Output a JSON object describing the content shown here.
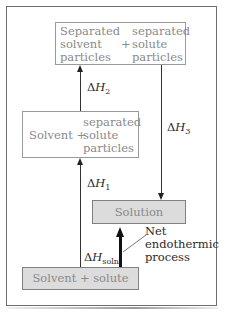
{
  "diagram": {
    "type": "enthalpy-of-solution",
    "boxes": {
      "top": {
        "left_col": [
          "Separated",
          "solvent",
          "particles"
        ],
        "plus": "+",
        "right_col": [
          "separated",
          "solute",
          "particles"
        ]
      },
      "middle": {
        "left": "Solvent +",
        "right_col": [
          "separated",
          "solute",
          "particles"
        ]
      },
      "solution": {
        "label": "Solution"
      },
      "bottom": {
        "label": "Solvent + solute"
      }
    },
    "arrows": {
      "dH1": {
        "delta": "Δ",
        "symbol": "H",
        "sub": "1",
        "direction": "up"
      },
      "dH2": {
        "delta": "Δ",
        "symbol": "H",
        "sub": "2",
        "direction": "up"
      },
      "dH3": {
        "delta": "Δ",
        "symbol": "H",
        "sub": "3",
        "direction": "down"
      },
      "dHsoln": {
        "delta": "Δ",
        "symbol": "H",
        "sub": "soln",
        "direction": "up"
      }
    },
    "annotation": {
      "lines": [
        "Net",
        "endothermic",
        "process"
      ]
    },
    "colors": {
      "frame": "#6d6d6d",
      "box_text": "#8a8a8a",
      "grey_fill": "#dcdcdc",
      "arrow": "#222222"
    }
  }
}
